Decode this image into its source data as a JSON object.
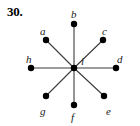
{
  "figure": {
    "exercise_number": "30.",
    "background_color": "#ffffff",
    "ink_color": "#000000",
    "edge_color": "#3c3c3c",
    "width": 140,
    "height": 126
  },
  "graph": {
    "type": "star",
    "center_vertex": "i",
    "center_position": {
      "x": 74,
      "y": 68
    },
    "vertex_radius": 3.2,
    "edge_width": 1.1,
    "vertices": [
      {
        "id": "a",
        "label": "a",
        "x": 46,
        "y": 40,
        "label_x": 40,
        "label_y": 26
      },
      {
        "id": "b",
        "label": "b",
        "x": 74,
        "y": 24,
        "label_x": 71,
        "label_y": 9
      },
      {
        "id": "c",
        "label": "c",
        "x": 103,
        "y": 40,
        "label_x": 102,
        "label_y": 26
      },
      {
        "id": "d",
        "label": "d",
        "x": 116,
        "y": 68,
        "label_x": 117,
        "label_y": 54
      },
      {
        "id": "e",
        "label": "e",
        "x": 104,
        "y": 96,
        "label_x": 106,
        "label_y": 106
      },
      {
        "id": "f",
        "label": "f",
        "x": 74,
        "y": 105,
        "label_x": 71,
        "label_y": 112
      },
      {
        "id": "g",
        "label": "g",
        "x": 46,
        "y": 96,
        "label_x": 40,
        "label_y": 106
      },
      {
        "id": "h",
        "label": "h",
        "x": 31,
        "y": 68,
        "label_x": 26,
        "label_y": 54
      },
      {
        "id": "i",
        "label": "i",
        "x": 74,
        "y": 68,
        "label_x": 81,
        "label_y": 56
      }
    ],
    "edges": [
      {
        "from": "i",
        "to": "a"
      },
      {
        "from": "i",
        "to": "b"
      },
      {
        "from": "i",
        "to": "c"
      },
      {
        "from": "i",
        "to": "d"
      },
      {
        "from": "i",
        "to": "e"
      },
      {
        "from": "i",
        "to": "f"
      },
      {
        "from": "i",
        "to": "g"
      },
      {
        "from": "i",
        "to": "h"
      }
    ]
  }
}
